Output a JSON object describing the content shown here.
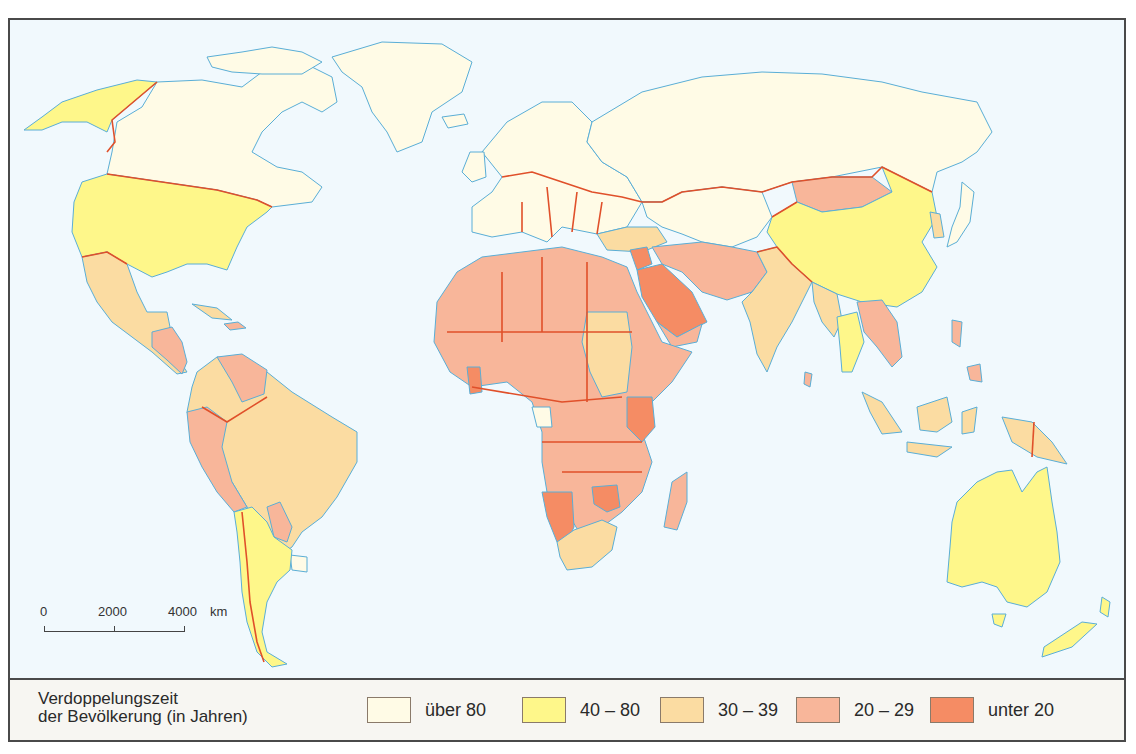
{
  "map": {
    "title": "Verdoppelungszeit der Bevölkerung (in Jahren)",
    "ocean_color": "#f1f9fd",
    "coast_color": "#5aaed6",
    "border_color": "#e0502a",
    "scale_bar": {
      "ticks": [
        "0",
        "2000",
        "4000"
      ],
      "unit": "km"
    }
  },
  "legend": {
    "title_line1": "Verdoppelungszeit",
    "title_line2": "der Bevölkerung (in Jahren)",
    "items": [
      {
        "label": "über 80",
        "color": "#fffbe6"
      },
      {
        "label": "40 – 80",
        "color": "#fef78a"
      },
      {
        "label": "30 – 39",
        "color": "#fbdca2"
      },
      {
        "label": "20 – 29",
        "color": "#f8b69a"
      },
      {
        "label": "unter 20",
        "color": "#f58c64"
      }
    ]
  },
  "regions": [
    {
      "name": "Canada",
      "class": "über 80"
    },
    {
      "name": "Greenland",
      "class": "über 80"
    },
    {
      "name": "Russia",
      "class": "über 80"
    },
    {
      "name": "Europe",
      "class": "über 80"
    },
    {
      "name": "Japan",
      "class": "über 80"
    },
    {
      "name": "USA",
      "class": "40 – 80"
    },
    {
      "name": "Alaska",
      "class": "40 – 80"
    },
    {
      "name": "China",
      "class": "40 – 80"
    },
    {
      "name": "Australia",
      "class": "40 – 80"
    },
    {
      "name": "New Zealand",
      "class": "40 – 80"
    },
    {
      "name": "Argentina",
      "class": "40 – 80"
    },
    {
      "name": "Chile",
      "class": "40 – 80"
    },
    {
      "name": "Thailand",
      "class": "40 – 80"
    },
    {
      "name": "Mexico",
      "class": "30 – 39"
    },
    {
      "name": "Brazil",
      "class": "30 – 39"
    },
    {
      "name": "Colombia",
      "class": "30 – 39"
    },
    {
      "name": "India",
      "class": "30 – 39"
    },
    {
      "name": "Indonesia",
      "class": "30 – 39"
    },
    {
      "name": "Turkey",
      "class": "30 – 39"
    },
    {
      "name": "Sudan",
      "class": "30 – 39"
    },
    {
      "name": "South Africa",
      "class": "30 – 39"
    },
    {
      "name": "Peru",
      "class": "20 – 29"
    },
    {
      "name": "Venezuela",
      "class": "20 – 29"
    },
    {
      "name": "Paraguay",
      "class": "20 – 29"
    },
    {
      "name": "Mongolia",
      "class": "20 – 29"
    },
    {
      "name": "Iran",
      "class": "20 – 29"
    },
    {
      "name": "Pakistan",
      "class": "20 – 29"
    },
    {
      "name": "North & Central Africa",
      "class": "20 – 29"
    },
    {
      "name": "Madagascar",
      "class": "20 – 29"
    },
    {
      "name": "Philippines",
      "class": "20 – 29"
    },
    {
      "name": "Saudi Arabia",
      "class": "unter 20"
    },
    {
      "name": "Kenya",
      "class": "unter 20"
    },
    {
      "name": "Namibia",
      "class": "unter 20"
    },
    {
      "name": "Zimbabwe",
      "class": "unter 20"
    },
    {
      "name": "Syria",
      "class": "unter 20"
    },
    {
      "name": "Ghana",
      "class": "unter 20"
    }
  ]
}
